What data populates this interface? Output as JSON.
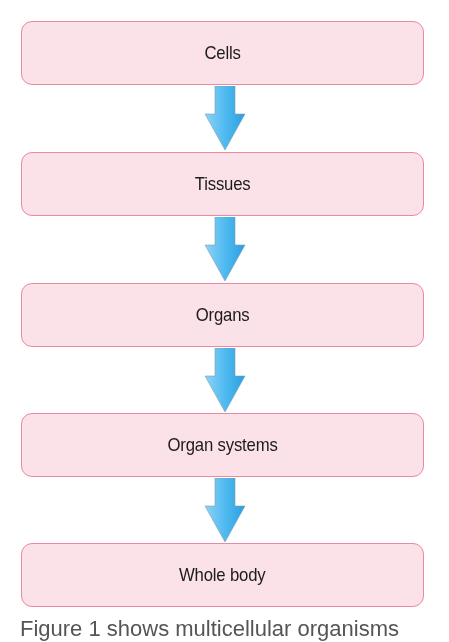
{
  "diagram": {
    "type": "flowchart",
    "direction": "top-to-bottom",
    "nodes": [
      {
        "label": "Cells"
      },
      {
        "label": "Tissues"
      },
      {
        "label": "Organs"
      },
      {
        "label": "Organ systems"
      },
      {
        "label": "Whole body"
      }
    ],
    "edges": [
      {
        "from": "Cells",
        "to": "Tissues"
      },
      {
        "from": "Tissues",
        "to": "Organs"
      },
      {
        "from": "Organs",
        "to": "Organ systems"
      },
      {
        "from": "Organ systems",
        "to": "Whole body"
      }
    ],
    "colors": {
      "box_fill": "#fbe1e8",
      "box_border": "#e98aa0",
      "arrow": "#3fb1ea"
    }
  },
  "caption": "Figure 1 shows multicellular organisms"
}
